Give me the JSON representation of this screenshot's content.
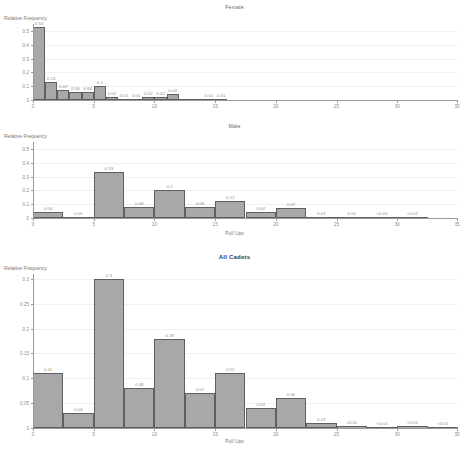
{
  "figure": {
    "name": "Relative Frequency of Pull Ups by Group",
    "xlabel": "Pull Ups",
    "ylabel": "Relative Frequency"
  },
  "charts": [
    {
      "title": "Female",
      "ylabel": "Relative Frequency",
      "xlabel": "",
      "xticks": [
        "0",
        "5",
        "10",
        "15",
        "20",
        "25",
        "30",
        "35"
      ],
      "yticks": [
        "0",
        "0.1",
        "0.2",
        "0.3",
        "0.4",
        "0.5"
      ]
    },
    {
      "title": "Male",
      "ylabel": "Relative Frequency",
      "xlabel": "Pull Ups",
      "xticks": [
        "0",
        "5",
        "10",
        "15",
        "20",
        "25",
        "30",
        "35"
      ],
      "yticks": [
        "0",
        "0.1",
        "0.2",
        "0.3",
        "0.4",
        "0.5"
      ]
    },
    {
      "title": "All Cadets",
      "ylabel": "Relative Frequency",
      "xlabel": "Pull Ups",
      "xticks": [
        "0",
        "5",
        "10",
        "15",
        "20",
        "25",
        "30",
        "35"
      ],
      "yticks": [
        "0",
        "0.05",
        "0.1",
        "0.15",
        "0.2",
        "0.25",
        "0.3"
      ]
    }
  ],
  "chart_data": [
    {
      "type": "bar",
      "title": "Female",
      "xlabel": "",
      "ylabel": "Relative Frequency",
      "xlim": [
        0,
        35
      ],
      "ylim": [
        0,
        0.55
      ],
      "grid": true,
      "legend": null,
      "bin_width": 1,
      "bin_edges": [
        0,
        1,
        2,
        3,
        4,
        5,
        6,
        7,
        8,
        9,
        10,
        11,
        12,
        13,
        14,
        15,
        16
      ],
      "categories": [
        "0-1",
        "1-2",
        "2-3",
        "3-4",
        "4-5",
        "5-6",
        "6-7",
        "7-8",
        "8-9",
        "9-10",
        "10-11",
        "11-12",
        "12-13",
        "13-14",
        "14-15",
        "15-16"
      ],
      "values": [
        0.53,
        0.13,
        0.07,
        0.06,
        0.06,
        0.1,
        0.02,
        0.01,
        0.01,
        0.02,
        0.02,
        0.04,
        0.0,
        0.0,
        0.01,
        0.01
      ],
      "labels": [
        "0.53",
        "0.13",
        "0.07",
        "0.06",
        "0.06",
        "0.1",
        "0.02",
        "0.01",
        "0.01",
        "0.02",
        "0.02",
        "0.04",
        "",
        "",
        "0.01",
        "0.01"
      ],
      "xticks": [
        0,
        5,
        10,
        15,
        20,
        25,
        30,
        35
      ],
      "yticks": [
        0,
        0.1,
        0.2,
        0.3,
        0.4,
        0.5
      ]
    },
    {
      "type": "bar",
      "title": "Male",
      "xlabel": "Pull Ups",
      "ylabel": "Relative Frequency",
      "xlim": [
        0,
        35
      ],
      "ylim": [
        0,
        0.55
      ],
      "grid": true,
      "legend": null,
      "bin_width": 2.5,
      "bin_edges": [
        0,
        2.5,
        5,
        7.5,
        10,
        12.5,
        15,
        17.5,
        20,
        22.5,
        25,
        27.5,
        30,
        32.5
      ],
      "categories": [
        "0-2.5",
        "2.5-5",
        "5-7.5",
        "7.5-10",
        "10-12.5",
        "12.5-15",
        "15-17.5",
        "17.5-20",
        "20-22.5",
        "22.5-25",
        "25-27.5",
        "27.5-30",
        "30-32.5"
      ],
      "values": [
        0.04,
        0.01,
        0.33,
        0.08,
        0.2,
        0.08,
        0.12,
        0.04,
        0.07,
        0.01,
        0.01,
        0.004,
        0.003
      ],
      "labels": [
        "0.04",
        "0.01",
        "0.33",
        "0.08",
        "0.2",
        "0.08",
        "0.12",
        "0.04",
        "0.07",
        "0.01",
        "0.01",
        "<0.01",
        "<0.01"
      ],
      "xticks": [
        0,
        5,
        10,
        15,
        20,
        25,
        30,
        35
      ],
      "yticks": [
        0,
        0.1,
        0.2,
        0.3,
        0.4,
        0.5
      ]
    },
    {
      "type": "bar",
      "title": "All Cadets",
      "xlabel": "Pull Ups",
      "ylabel": "Relative Frequency",
      "xlim": [
        0,
        35
      ],
      "ylim": [
        0,
        0.31
      ],
      "grid": true,
      "legend": null,
      "bin_width": 2.5,
      "bin_edges": [
        0,
        2.5,
        5,
        7.5,
        10,
        12.5,
        15,
        17.5,
        20,
        22.5,
        25,
        27.5,
        30,
        32.5,
        35
      ],
      "categories": [
        "0-2.5",
        "2.5-5",
        "5-7.5",
        "7.5-10",
        "10-12.5",
        "12.5-15",
        "15-17.5",
        "17.5-20",
        "20-22.5",
        "22.5-25",
        "25-27.5",
        "27.5-30",
        "30-32.5",
        "32.5-35"
      ],
      "values": [
        0.11,
        0.03,
        0.3,
        0.08,
        0.18,
        0.07,
        0.11,
        0.04,
        0.06,
        0.01,
        0.004,
        0.003,
        0.004,
        0.002
      ],
      "labels": [
        "0.11",
        "0.03",
        "0.3",
        "0.08",
        "0.18",
        "0.07",
        "0.11",
        "0.04",
        "0.06",
        "0.01",
        "<0.01",
        "<0.01",
        "<0.01",
        "<0.01"
      ],
      "xticks": [
        0,
        5,
        10,
        15,
        20,
        25,
        30,
        35
      ],
      "yticks": [
        0,
        0.05,
        0.1,
        0.15,
        0.2,
        0.25,
        0.3
      ]
    }
  ]
}
